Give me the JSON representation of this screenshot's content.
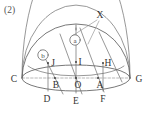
{
  "figure": {
    "caption": "(2)",
    "type": "hemisphere-geometry-diagram",
    "stroke_color": "#555555",
    "label_color": "#333333",
    "background": "#ffffff"
  },
  "labels": {
    "caption": "(2)",
    "apex_marker": "X",
    "circled_a": "a",
    "circled_b": "b",
    "base_left": "C",
    "base_right": "G",
    "base_center": "O",
    "base_b": "B",
    "base_a": "A",
    "front_d": "D",
    "front_e": "E",
    "front_f": "F",
    "upper_j": "J",
    "upper_i": "I",
    "upper_h": "H"
  },
  "points": {
    "C": {
      "x": 22,
      "y": 78
    },
    "G": {
      "x": 130,
      "y": 78
    },
    "O": {
      "x": 76,
      "y": 78
    },
    "B": {
      "x": 55,
      "y": 78
    },
    "A": {
      "x": 98,
      "y": 78
    },
    "D": {
      "x": 48,
      "y": 91
    },
    "E": {
      "x": 76,
      "y": 93
    },
    "F": {
      "x": 103,
      "y": 91
    },
    "J": {
      "x": 48,
      "y": 63
    },
    "I": {
      "x": 76,
      "y": 62
    },
    "H": {
      "x": 103,
      "y": 63
    },
    "X": {
      "x": 100,
      "y": 16
    },
    "circled_a": {
      "x": 75,
      "y": 40
    },
    "circled_b": {
      "x": 43,
      "y": 55
    },
    "apex": {
      "x": 76,
      "y": 22
    }
  },
  "geometry": {
    "base_ellipse_cx": 76,
    "base_ellipse_cy": 78,
    "base_ellipse_rx": 54,
    "base_ellipse_ry": 13,
    "dome_radius": 54,
    "dome_top_y": 24
  }
}
